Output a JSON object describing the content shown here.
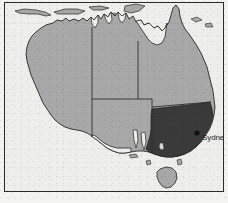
{
  "figure": {
    "name": "map-of-australia",
    "background_color": "#f3f3f1",
    "frame_color": "#2b2b2b",
    "ocean_color": "#eeeeec"
  },
  "map": {
    "title": "Australia",
    "projection_note": "",
    "land_color": "#a8a8a8",
    "highlight_color": "#3a3a3a",
    "coast_line_color": "#262626",
    "state_border_color": "#2f2f2f",
    "island_color": "#a8a8a8"
  },
  "regions": [
    {
      "id": "western-australia",
      "label": "Western Australia",
      "fill": "#a8a8a8",
      "highlighted": "false"
    },
    {
      "id": "northern-territory",
      "label": "Northern Territory",
      "fill": "#a8a8a8",
      "highlighted": "false"
    },
    {
      "id": "queensland",
      "label": "Queensland",
      "fill": "#a8a8a8",
      "highlighted": "false"
    },
    {
      "id": "south-australia",
      "label": "South Australia",
      "fill": "#a8a8a8",
      "highlighted": "false"
    },
    {
      "id": "new-south-wales-victoria",
      "label": "New South Wales and Victoria",
      "fill": "#3a3a3a",
      "highlighted": "true"
    },
    {
      "id": "tasmania",
      "label": "Tasmania",
      "fill": "#a8a8a8",
      "highlighted": "false"
    },
    {
      "id": "northern-islands",
      "label": "Northern islands",
      "fill": "#a8a8a8",
      "highlighted": "false"
    }
  ],
  "markers": [
    {
      "id": "sydney",
      "label": "Sydney",
      "dot_color": "#111111",
      "label_color": "#1d1d1d",
      "x": 196,
      "y": 132,
      "label_x": 201,
      "label_y": 135
    }
  ]
}
